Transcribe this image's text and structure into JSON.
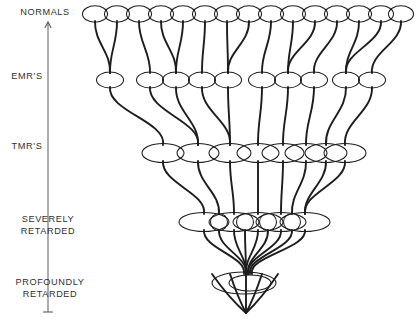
{
  "figure": {
    "type": "diagram",
    "subtype": "inverted-funnel-hierarchy",
    "background_color": "#ffffff",
    "line_color": "#1d1d1d",
    "axis_color": "#5a5a5a",
    "text_color": "#303030",
    "width": 417,
    "height": 319
  },
  "axis": {
    "name": "severity-axis",
    "orientation": "vertical",
    "top_marker": "arrowhead",
    "bottom_marker": "t-bar",
    "x": 48,
    "top_y": 22,
    "bottom_y": 312,
    "labels": [
      {
        "id": "normals",
        "lines": [
          "NORMALS"
        ],
        "x": 45,
        "y": 15
      },
      {
        "id": "emrs",
        "lines": [
          "EMR'S"
        ],
        "x": 27,
        "y": 79
      },
      {
        "id": "tmrs",
        "lines": [
          "TMR'S"
        ],
        "x": 27,
        "y": 149
      },
      {
        "id": "severely-retarded",
        "lines": [
          "SEVERELY",
          "RETARDED"
        ],
        "x": 48,
        "y": 222
      },
      {
        "id": "profoundly-retarded",
        "lines": [
          "PROFOUNDLY",
          "RETARDED"
        ],
        "x": 50,
        "y": 285
      }
    ]
  },
  "tiers": [
    {
      "id": "tier-normals",
      "label": "NORMALS",
      "level": 0,
      "cy": 14,
      "rx": 12.5,
      "ry": 8.2,
      "count": 15,
      "cx": [
        95,
        117,
        139,
        161,
        183,
        205,
        227,
        249,
        271,
        293,
        315,
        337,
        359,
        381,
        401
      ]
    },
    {
      "id": "tier-emrs",
      "label": "EMR'S",
      "level": 1,
      "cy": 80,
      "rx": 13.5,
      "ry": 8.0,
      "count": 10,
      "cx": [
        110,
        150,
        176,
        202,
        228,
        262,
        288,
        314,
        346,
        372
      ]
    },
    {
      "id": "tier-tmrs",
      "label": "TMR'S",
      "level": 2,
      "cy": 153,
      "rx": 21,
      "ry": 9.5,
      "count": 8,
      "cx": [
        163,
        198,
        230,
        258,
        283,
        306,
        326,
        345
      ]
    },
    {
      "id": "tier-severely-retarded",
      "label": "SEVERELY RETARDED",
      "level": 3,
      "cy": 222,
      "rx": 25,
      "ry": 9.5,
      "count": 5,
      "cx": [
        204,
        234,
        258,
        281,
        305
      ],
      "inner_nodes": {
        "rx": 8.5,
        "ry": 8.5,
        "cx": [
          219,
          245,
          268,
          292
        ]
      }
    },
    {
      "id": "tier-profoundly-retarded",
      "label": "PROFOUNDLY RETARDED",
      "level": 4,
      "cy": 283,
      "count": 2,
      "ellipses": [
        {
          "cx": 244,
          "rx": 32,
          "ry": 11
        },
        {
          "cx": 250,
          "rx": 21,
          "ry": 8
        }
      ]
    }
  ],
  "apex": {
    "x": 246,
    "y": 313
  },
  "links": {
    "description": "curved lineage lines connecting each tier downward toward the apex",
    "level_0_to_1": [
      [
        95,
        110
      ],
      [
        117,
        110
      ],
      [
        139,
        150
      ],
      [
        161,
        176
      ],
      [
        183,
        176
      ],
      [
        205,
        202
      ],
      [
        227,
        228
      ],
      [
        249,
        228
      ],
      [
        271,
        262
      ],
      [
        293,
        288
      ],
      [
        315,
        288
      ],
      [
        337,
        314
      ],
      [
        359,
        346
      ],
      [
        381,
        346
      ],
      [
        401,
        372
      ]
    ],
    "level_1_to_2": [
      [
        110,
        163
      ],
      [
        150,
        198
      ],
      [
        176,
        198
      ],
      [
        202,
        230
      ],
      [
        228,
        230
      ],
      [
        262,
        258
      ],
      [
        288,
        283
      ],
      [
        314,
        306
      ],
      [
        346,
        326
      ],
      [
        372,
        345
      ]
    ],
    "level_2_to_3": [
      [
        163,
        204
      ],
      [
        198,
        219
      ],
      [
        230,
        234
      ],
      [
        258,
        258
      ],
      [
        283,
        281
      ],
      [
        306,
        292
      ],
      [
        326,
        305
      ],
      [
        345,
        305
      ]
    ],
    "level_3_to_4": [
      [
        204,
        244
      ],
      [
        219,
        246
      ],
      [
        234,
        246
      ],
      [
        245,
        246
      ],
      [
        258,
        246
      ],
      [
        268,
        248
      ],
      [
        281,
        248
      ],
      [
        292,
        250
      ],
      [
        305,
        252
      ]
    ],
    "level_4_to_apex": [
      [
        212,
        246
      ],
      [
        230,
        246
      ],
      [
        246,
        246
      ],
      [
        262,
        246
      ],
      [
        278,
        246
      ]
    ]
  }
}
